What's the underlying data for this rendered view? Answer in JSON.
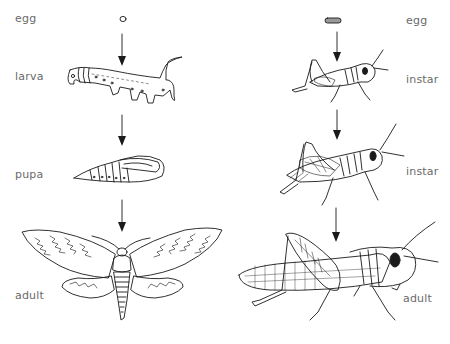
{
  "diagram": {
    "title": "",
    "left_sequence": {
      "name": "complete metamorphosis (moth)",
      "stages": [
        {
          "label": "egg"
        },
        {
          "label": "larva"
        },
        {
          "label": "pupa"
        },
        {
          "label": "adult"
        }
      ]
    },
    "right_sequence": {
      "name": "incomplete metamorphosis (grasshopper)",
      "stages": [
        {
          "label": "egg"
        },
        {
          "label": "instar"
        },
        {
          "label": "instar"
        },
        {
          "label": "adult"
        }
      ]
    },
    "colors": {
      "line": "#1a1a1a",
      "label": "#6a6a6a",
      "background": "#ffffff"
    }
  }
}
